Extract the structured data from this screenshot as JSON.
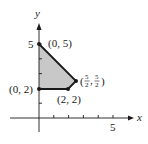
{
  "diagram": {
    "type": "feasible-region",
    "axes": {
      "x_label": "x",
      "y_label": "y",
      "x_tick_label": "5",
      "y_tick_label": "5",
      "x_ticks": [
        1,
        2,
        3,
        4,
        5
      ],
      "y_ticks": [
        1,
        2,
        3,
        4,
        5
      ]
    },
    "region": {
      "fill_color": "#c8c8c8",
      "edge_color": "#1a1a1a",
      "vertices": [
        {
          "x": 0,
          "y": 5,
          "label": "(0, 5)"
        },
        {
          "x": 2.5,
          "y": 2.5,
          "label": "(5/2, 5/2)"
        },
        {
          "x": 2,
          "y": 2,
          "label": "(2, 2)"
        },
        {
          "x": 0,
          "y": 2,
          "label": "(0, 2)"
        }
      ]
    },
    "labels": {
      "v05": "(0, 5)",
      "v02": "(0, 2)",
      "v22": "(2, 2)",
      "v2525_open": "(",
      "v2525_num": "5",
      "v2525_den": "2",
      "v2525_comma": ",",
      "v2525_close": ")"
    }
  }
}
